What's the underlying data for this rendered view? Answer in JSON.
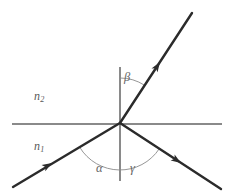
{
  "figure": {
    "width": 234,
    "height": 196,
    "background_color": "#ffffff"
  },
  "labels": {
    "medium_upper": {
      "symbol": "n",
      "subscript": "2",
      "x": 34,
      "y": 90,
      "color": "#5a5a5a"
    },
    "medium_lower": {
      "symbol": "n",
      "subscript": "1",
      "x": 34,
      "y": 140,
      "color": "#5a5a5a"
    },
    "angle_beta": {
      "text": "β",
      "x": 124,
      "y": 71,
      "color": "#666666"
    },
    "angle_alpha": {
      "text": "α",
      "x": 96,
      "y": 162,
      "color": "#666666"
    },
    "angle_gamma": {
      "text": "γ",
      "x": 130,
      "y": 162,
      "color": "#666666"
    }
  },
  "geometry": {
    "origin": {
      "x": 120,
      "y": 123
    },
    "interface_line": {
      "x1": 12,
      "y1": 124,
      "x2": 222,
      "y2": 124,
      "color": "#8a8a8a",
      "width": 1.1
    },
    "normal_line": {
      "x1": 120,
      "y1": 67,
      "x2": 120,
      "y2": 181,
      "color": "#8a8a8a",
      "width": 1.1
    },
    "rays": [
      {
        "name": "incident-ray",
        "x1": 13,
        "y1": 187,
        "x2": 120,
        "y2": 123,
        "color": "#2b2b2b",
        "width": 2.4,
        "arrow": {
          "x": 48,
          "y": 166,
          "angle_deg": -30.9
        }
      },
      {
        "name": "refracted-ray",
        "x1": 120,
        "y1": 123,
        "x2": 192,
        "y2": 13,
        "color": "#2b2b2b",
        "width": 2.4,
        "arrow": {
          "x": 158,
          "y": 65,
          "angle_deg": -56.8
        }
      },
      {
        "name": "reflected-ray",
        "x1": 120,
        "y1": 123,
        "x2": 221,
        "y2": 189,
        "color": "#2b2b2b",
        "width": 2.4,
        "arrow": {
          "x": 176,
          "y": 160,
          "angle_deg": 33.2
        }
      }
    ],
    "arcs": [
      {
        "name": "beta-arc",
        "radius": 45,
        "start_angle_deg": 90,
        "end_angle_deg": 56.8,
        "color": "#8a8a8a",
        "width": 0.9
      },
      {
        "name": "alpha-gamma-arc",
        "radius": 47,
        "start_angle_deg": 210.9,
        "end_angle_deg": 326.8,
        "color": "#8a8a8a",
        "width": 0.9
      }
    ]
  }
}
